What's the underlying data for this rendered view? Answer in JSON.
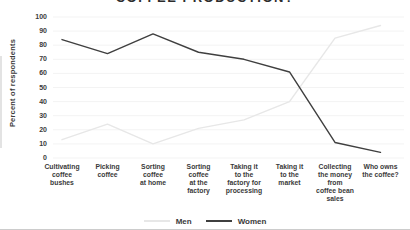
{
  "chart_data": {
    "type": "line",
    "title": "COFFEE PRODUCTION?",
    "ylabel": "Percent of respondents",
    "ylim": [
      0,
      100
    ],
    "yticks": [
      0,
      10,
      20,
      30,
      40,
      50,
      60,
      70,
      80,
      90,
      100
    ],
    "grid": "horizontal",
    "legend_position": "bottom",
    "categories": [
      "Cultivating\ncoffee\nbushes",
      "Picking\ncoffee",
      "Sorting\ncoffee\nat home",
      "Sorting\ncoffee\nat the\nfactory",
      "Taking it\nto the\nfactory for\nprocessing",
      "Taking it\nto the\nmarket",
      "Collecting\nthe money\nfrom\ncoffee bean\nsales",
      "Who owns\nthe coffee?"
    ],
    "series": [
      {
        "name": "Men",
        "color": "#e7e7e7",
        "values": [
          13,
          24,
          10,
          21,
          27,
          40,
          85,
          94
        ]
      },
      {
        "name": "Women",
        "color": "#3f3f3f",
        "values": [
          84,
          74,
          88,
          75,
          70,
          61,
          11,
          4
        ]
      }
    ]
  },
  "colors": {
    "gridline": "#f3f3f3",
    "text": "#3a3a3a",
    "bottom_divider": "#cccccc"
  }
}
